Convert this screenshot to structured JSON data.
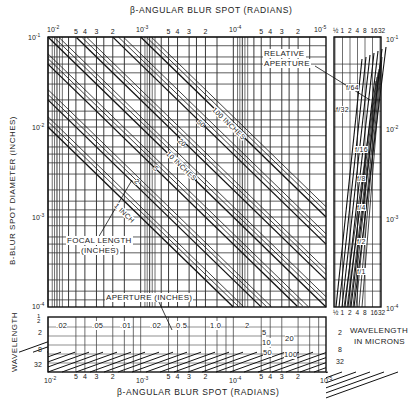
{
  "chart_data": {
    "type": "line",
    "top_xlabel": "β-ANGULAR BLUR SPOT (RADIANS)",
    "bottom_xlabel": "β-ANGULAR BLUR SPOT (RADIANS)",
    "ylabel": "B-BLUR SPOT DIAMETER (INCHES)",
    "xscale": "log",
    "yscale": "log",
    "xlim": [
      0.01,
      1e-05
    ],
    "ylim": [
      0.0001,
      0.1
    ],
    "x_decade_labels": [
      "10^-2",
      "10^-3",
      "10^-4",
      "10^-5"
    ],
    "x_minor_tick_labels": [
      "5",
      "4",
      "3",
      "2"
    ],
    "y_decade_labels": [
      "10^-1",
      "10^-2",
      "10^-3",
      "10^-4"
    ],
    "grid": true,
    "focal_length_series": {
      "label": "FOCAL LENGTH (INCHES)",
      "relation": "B = beta * f",
      "series": [
        {
          "name": "1 INCH",
          "f": 1
        },
        {
          "name": "2",
          "f": 2
        },
        {
          "name": "5",
          "f": 5
        },
        {
          "name": "10 INCHES",
          "f": 10
        },
        {
          "name": "20",
          "f": 20
        },
        {
          "name": "50",
          "f": 50
        },
        {
          "name": "100 INCHES",
          "f": 100
        }
      ]
    },
    "relative_aperture_panel": {
      "label": "RELATIVE APERTURE",
      "xlabel": "WAVELENGTH IN MICRONS",
      "x_tick_labels": [
        "1/2",
        "1",
        "2",
        "4",
        "8",
        "16",
        "32"
      ],
      "y_tick_labels": [
        "10^-1",
        "10^-2",
        "10^-3",
        "10^-4"
      ],
      "series": [
        "f/1",
        "f/2",
        "f/4",
        "f/8",
        "f/16",
        "f/32",
        "f/64"
      ]
    },
    "aperture_panel": {
      "label": "APERTURE (INCHES)",
      "ylabel": "WAVELENGTH",
      "y_tick_labels": [
        "1/2",
        "2",
        "8",
        "32"
      ],
      "right_y_tick_labels": [
        "2",
        "8",
        "32"
      ],
      "series": [
        ".02",
        ".05",
        ".01",
        ".02",
        "0.5",
        "1.0",
        "2",
        "5",
        "10",
        "20",
        "50",
        "100"
      ]
    }
  },
  "labels": {
    "top_title": "β-ANGULAR BLUR SPOT (RADIANS)",
    "bottom_title": "β-ANGULAR BLUR SPOT (RADIANS)",
    "y_axis": "B-BLUR SPOT DIAMETER (INCHES)",
    "wavelength_left": "WAVELENGTH",
    "wavelength_right_1": "WAVELENGTH",
    "wavelength_right_2": "IN MICRONS",
    "relative_aperture_1": "RELATIVE",
    "relative_aperture_2": "APERTURE",
    "focal_length_1": "FOCAL LENGTH",
    "focal_length_2": "(INCHES)",
    "aperture_inches": "APERTURE (INCHES)",
    "fl_1": "1 INCH",
    "fl_2": "2",
    "fl_5": "5",
    "fl_10": "10 INCHES",
    "fl_20": "20",
    "fl_50": "50",
    "fl_100": "100 INCHES"
  }
}
